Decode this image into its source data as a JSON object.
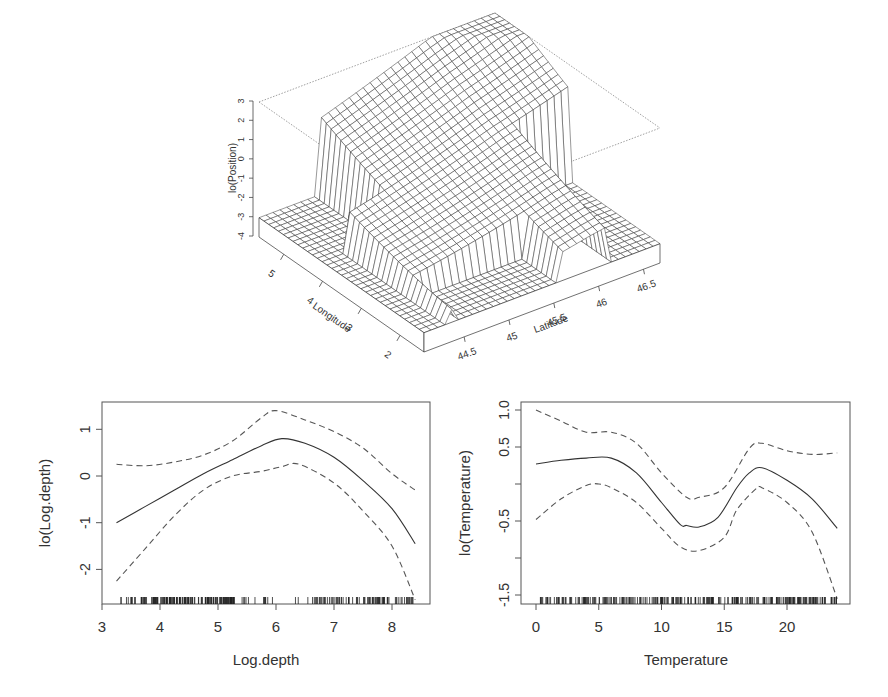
{
  "chart_data": [
    {
      "type": "surface3d",
      "title": "",
      "xlabel": "Latitude",
      "ylabel": "Longitude",
      "zlabel": "lo(Position)",
      "x_ticks": [
        "44.5",
        "45",
        "45.5",
        "46",
        "46.5"
      ],
      "y_ticks": [
        "2",
        "3",
        "4",
        "5"
      ],
      "z_ticks": [
        "3",
        "2",
        "1",
        "0",
        "-1",
        "-2",
        "-3",
        "-4"
      ],
      "zlim": [
        -4,
        3
      ],
      "description": "Wireframe perspective surface; flat floor at about -3 outside data region, peak near 3 at high latitude / high longitude corner, with vertical walls at region boundaries"
    },
    {
      "type": "line",
      "title": "",
      "xlabel": "Log.depth",
      "ylabel": "lo(Log.depth)",
      "x_ticks": [
        "3",
        "4",
        "5",
        "6",
        "7",
        "8"
      ],
      "y_ticks": [
        "1",
        "0",
        "-1",
        "-2"
      ],
      "xlim": [
        3.0,
        8.65
      ],
      "ylim": [
        -2.75,
        1.6
      ],
      "rug": true,
      "series": [
        {
          "name": "fit",
          "style": "solid",
          "x": [
            3.25,
            3.75,
            4.25,
            4.75,
            5.25,
            5.75,
            6.1,
            6.5,
            7.0,
            7.5,
            8.0,
            8.4
          ],
          "values": [
            -1.0,
            -0.65,
            -0.3,
            0.05,
            0.35,
            0.65,
            0.8,
            0.7,
            0.4,
            -0.1,
            -0.7,
            -1.45
          ]
        },
        {
          "name": "upper band",
          "style": "dashed",
          "x": [
            3.25,
            3.75,
            4.25,
            4.75,
            5.25,
            5.75,
            6.0,
            6.5,
            7.0,
            7.5,
            8.0,
            8.4
          ],
          "values": [
            0.25,
            0.22,
            0.3,
            0.45,
            0.75,
            1.25,
            1.4,
            1.2,
            0.95,
            0.6,
            0.05,
            -0.3
          ]
        },
        {
          "name": "lower band",
          "style": "dashed",
          "x": [
            3.25,
            3.75,
            4.25,
            4.75,
            5.25,
            5.75,
            6.1,
            6.4,
            7.0,
            7.5,
            8.0,
            8.4
          ],
          "values": [
            -2.25,
            -1.55,
            -0.85,
            -0.3,
            0.0,
            0.1,
            0.2,
            0.25,
            -0.15,
            -0.75,
            -1.5,
            -2.65
          ]
        }
      ]
    },
    {
      "type": "line",
      "title": "",
      "xlabel": "Temperature",
      "ylabel": "lo(Temperature)",
      "x_ticks": [
        "0",
        "5",
        "10",
        "15",
        "20"
      ],
      "y_ticks": [
        "1.0",
        "0.5",
        "-0.5",
        "-1.5"
      ],
      "xlim": [
        -1.2,
        25.0
      ],
      "ylim": [
        -1.62,
        1.1
      ],
      "rug": true,
      "series": [
        {
          "name": "fit",
          "style": "solid",
          "x": [
            0,
            2,
            4,
            6,
            8,
            10,
            11.5,
            12,
            13,
            14.5,
            16,
            17,
            18,
            20,
            22,
            24
          ],
          "values": [
            0.27,
            0.32,
            0.35,
            0.35,
            0.15,
            -0.25,
            -0.55,
            -0.56,
            -0.58,
            -0.45,
            -0.05,
            0.15,
            0.22,
            0.05,
            -0.2,
            -0.6
          ]
        },
        {
          "name": "upper band",
          "style": "dashed",
          "x": [
            0,
            2,
            4,
            6,
            8,
            10,
            12,
            13,
            15,
            17,
            18,
            20,
            22,
            24
          ],
          "values": [
            1.0,
            0.85,
            0.7,
            0.7,
            0.55,
            0.15,
            -0.18,
            -0.18,
            -0.05,
            0.48,
            0.55,
            0.45,
            0.4,
            0.42
          ]
        },
        {
          "name": "lower band",
          "style": "dashed",
          "x": [
            0,
            2,
            4,
            5,
            6,
            8,
            10,
            11.5,
            13,
            15,
            16,
            17.5,
            18,
            20,
            22,
            24
          ],
          "values": [
            -0.48,
            -0.2,
            -0.02,
            0.0,
            -0.05,
            -0.25,
            -0.6,
            -0.85,
            -0.9,
            -0.72,
            -0.35,
            -0.07,
            -0.05,
            -0.25,
            -0.65,
            -1.55
          ]
        }
      ]
    }
  ],
  "surface": {
    "zlabel": "lo(Position)",
    "xlabel": "Latitude",
    "ylabel": "Longitude",
    "z_ticks": [
      "3",
      "2",
      "1",
      "0",
      "-1",
      "-2",
      "-3",
      "-4"
    ],
    "lon_ticks": [
      "5",
      "4",
      "3",
      "2"
    ],
    "lat_ticks": [
      "44.5",
      "45",
      "45.5",
      "46",
      "46.5"
    ]
  },
  "left_plot": {
    "xlabel": "Log.depth",
    "ylabel": "lo(Log.depth)",
    "x_ticks": [
      "3",
      "4",
      "5",
      "6",
      "7",
      "8"
    ],
    "y_ticks": [
      "1",
      "0",
      "-1",
      "-2"
    ]
  },
  "right_plot": {
    "xlabel": "Temperature",
    "ylabel": "lo(Temperature)",
    "x_ticks": [
      "0",
      "5",
      "10",
      "15",
      "20"
    ],
    "y_ticks": [
      "1.0",
      "0.5",
      "-0.5",
      "-1.5"
    ]
  },
  "colors": {
    "line": "#333333",
    "dashed": "#555555",
    "axis": "#444444",
    "box_dotted": "#888888"
  }
}
